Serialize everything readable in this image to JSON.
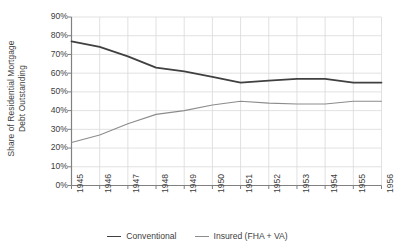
{
  "chart_data": {
    "type": "line",
    "title": "",
    "xlabel": "",
    "ylabel": "Share of Residential Mortgage Debt Outstanding",
    "ylabel_line1": "Share of Residential Mortgage",
    "ylabel_line2": "Debt Outstanding",
    "categories": [
      "1945",
      "1946",
      "1947",
      "1948",
      "1949",
      "1950",
      "1951",
      "1952",
      "1953",
      "1954",
      "1955",
      "1956"
    ],
    "x": [
      1945,
      1946,
      1947,
      1948,
      1949,
      1950,
      1951,
      1952,
      1953,
      1954,
      1955,
      1956
    ],
    "ylim": [
      0,
      90
    ],
    "ytick_labels": [
      "0%",
      "10%",
      "20%",
      "30%",
      "40%",
      "50%",
      "60%",
      "70%",
      "80%",
      "90%"
    ],
    "ytick_values": [
      0,
      10,
      20,
      30,
      40,
      50,
      60,
      70,
      80,
      90
    ],
    "grid": true,
    "legend_position": "bottom",
    "series": [
      {
        "name": "Conventional",
        "color": "#404040",
        "width": 1.8,
        "values": [
          77,
          74,
          69,
          63,
          61,
          58,
          55,
          56,
          57,
          57,
          55,
          55
        ]
      },
      {
        "name": "Insured (FHA + VA)",
        "color": "#8c8c8c",
        "width": 1.1,
        "values": [
          23,
          27,
          33,
          38,
          40,
          43,
          45,
          44,
          43.5,
          43.5,
          45,
          45
        ]
      }
    ]
  },
  "legend": {
    "items": [
      {
        "label": "Conventional",
        "color": "#404040"
      },
      {
        "label": "Insured (FHA + VA)",
        "color": "#8c8c8c"
      }
    ]
  },
  "axis": {
    "axis_color": "#808080",
    "grid_color": "#d9d9d9",
    "text_color": "#404040"
  }
}
